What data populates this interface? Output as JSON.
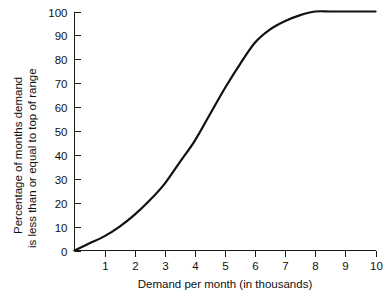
{
  "chart_data": {
    "type": "line",
    "title": "",
    "subtitle": "",
    "xlabel": "Demand per month (in thousands)",
    "ylabel_line1": "Percentage of months demand",
    "ylabel_line2": "is less than or equal to top of range",
    "xlim": [
      0,
      10
    ],
    "ylim": [
      0,
      100
    ],
    "grid": false,
    "legend": false,
    "legend_position": "none",
    "xticks": [
      0,
      1,
      2,
      3,
      4,
      5,
      6,
      7,
      8,
      9,
      10
    ],
    "xtick_labels": [
      "",
      "1",
      "2",
      "3",
      "4",
      "5",
      "6",
      "7",
      "8",
      "9",
      "10"
    ],
    "yticks": [
      0,
      10,
      20,
      30,
      40,
      50,
      60,
      70,
      80,
      90,
      100
    ],
    "ytick_labels": [
      "0",
      "10",
      "20",
      "30",
      "40",
      "50",
      "60",
      "70",
      "80",
      "90",
      "100"
    ],
    "line_color": "#111111",
    "axis_color": "#1a1a1a",
    "background_color": "#ffffff",
    "series": [
      {
        "name": "Cumulative percentage of months",
        "x": [
          0,
          0.5,
          1,
          1.5,
          2,
          2.5,
          3,
          3.5,
          4,
          4.5,
          5,
          5.5,
          6,
          6.5,
          7,
          7.5,
          8,
          8.5,
          9,
          9.5,
          10
        ],
        "values": [
          0,
          3,
          6,
          10,
          15,
          21,
          28,
          37,
          46,
          57,
          68,
          78,
          87,
          92.5,
          96,
          98.5,
          100,
          100,
          100,
          100,
          100
        ]
      }
    ]
  },
  "axis_labels": {
    "y_title_line1": "Percentage of months demand",
    "y_title_line2": "is less than or equal to top of range",
    "x_title": "Demand per month (in thousands)"
  }
}
